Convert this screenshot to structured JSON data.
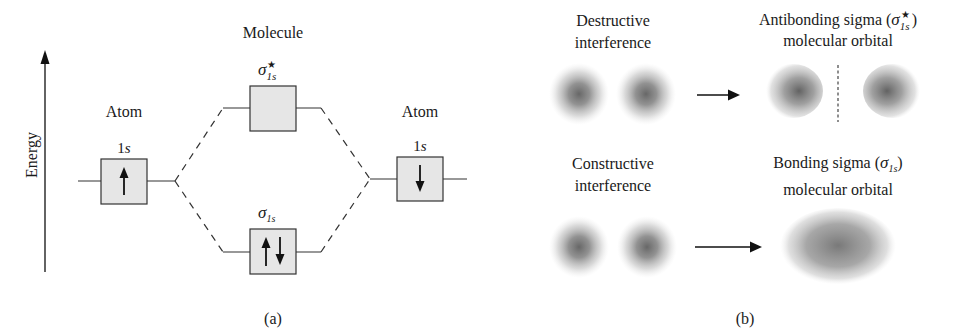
{
  "panel_a": {
    "axis_label": "Energy",
    "molecule_label": "Molecule",
    "left_atom": {
      "label": "Atom",
      "orbital": "1s",
      "orbital_num": "1",
      "orbital_letter": "s",
      "electrons": "up"
    },
    "right_atom": {
      "label": "Atom",
      "orbital": "1s",
      "orbital_num": "1",
      "orbital_letter": "s",
      "electrons": "down"
    },
    "antibonding": {
      "symbol": "σ",
      "sub": "1s",
      "sup": "★",
      "electrons": "none"
    },
    "bonding": {
      "symbol": "σ",
      "sub": "1s",
      "electrons": "up-down"
    },
    "caption": "(a)"
  },
  "panel_b": {
    "destructive": {
      "line1": "Destructive",
      "line2": "interference"
    },
    "constructive": {
      "line1": "Constructive",
      "line2": "interference"
    },
    "antibonding": {
      "line1_prefix": "Antibonding sigma (",
      "symbol": "σ",
      "sub": "1s",
      "sup": "★",
      "line1_suffix": ")",
      "line2": "molecular orbital"
    },
    "bonding": {
      "line1_prefix": "Bonding sigma (",
      "symbol": "σ",
      "sub": "1s",
      "line1_suffix": ")",
      "line2": "molecular orbital"
    },
    "caption": "(b)"
  },
  "colors": {
    "box_fill": "#e6e6e6",
    "stroke": "#222222",
    "cloud": "#6e6e6e"
  }
}
